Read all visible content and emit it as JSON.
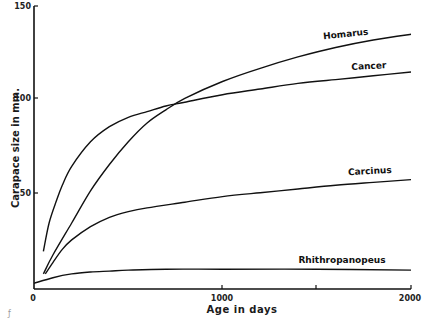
{
  "chart_data": {
    "type": "line",
    "title": "",
    "xlabel": "Age in days",
    "ylabel": "Carapace size in mm.",
    "xlim": [
      0,
      2000
    ],
    "ylim": [
      0,
      150
    ],
    "x_ticks": [
      0,
      1000,
      2000
    ],
    "x_minor_ticks": [
      1500
    ],
    "y_ticks": [
      50,
      100,
      150
    ],
    "grid": false,
    "legend": "inline labels at right end of each curve",
    "series": [
      {
        "name": "Homarus",
        "x": [
          50,
          100,
          200,
          300,
          400,
          500,
          600,
          700,
          800,
          1000,
          1200,
          1400,
          1600,
          1800,
          2000
        ],
        "y": [
          8,
          18,
          35,
          52,
          66,
          78,
          88,
          95,
          101,
          110,
          117,
          123,
          128,
          132,
          135
        ]
      },
      {
        "name": "Cancer",
        "x": [
          50,
          80,
          120,
          150,
          200,
          300,
          400,
          500,
          600,
          700,
          800,
          1000,
          1200,
          1400,
          1600,
          1800,
          2000
        ],
        "y": [
          20,
          35,
          47,
          55,
          65,
          78,
          86,
          91,
          94,
          97,
          99,
          103,
          106,
          109,
          111,
          113,
          115
        ]
      },
      {
        "name": "Carcinus",
        "x": [
          60,
          100,
          150,
          200,
          300,
          400,
          500,
          600,
          800,
          1000,
          1200,
          1400,
          1600,
          1800,
          2000
        ],
        "y": [
          8,
          14,
          21,
          26,
          33,
          38,
          41,
          43,
          46,
          49,
          51,
          53,
          55,
          56.5,
          58
        ]
      },
      {
        "name": "Rhithropanopeus",
        "x": [
          0,
          100,
          200,
          300,
          400,
          500,
          700,
          1000,
          1500,
          2000
        ],
        "y": [
          3,
          6,
          8,
          9,
          9.5,
          10,
          10.5,
          10.5,
          10.5,
          10
        ]
      }
    ],
    "annotations": [
      "Homarus",
      "Cancer",
      "Carcinus",
      "Rhithropanopeus"
    ]
  },
  "axes": {
    "x_tick_labels": [
      "0",
      "1000",
      "2000"
    ],
    "y_tick_labels": [
      "50",
      "100",
      "150"
    ],
    "xlabel": "Age in days",
    "ylabel": "Carapace size in mm."
  },
  "labels": {
    "homarus": "Homarus",
    "cancer": "Cancer",
    "carcinus": "Carcinus",
    "rhithropanopeus": "Rhithropanopeus"
  }
}
